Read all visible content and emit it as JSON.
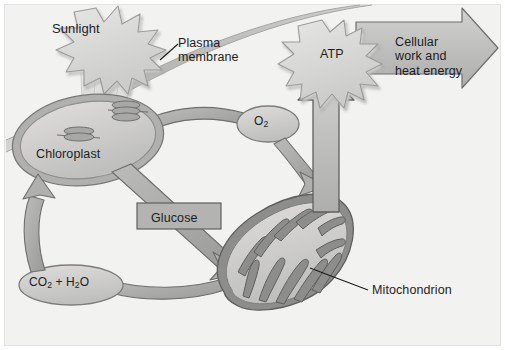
{
  "diagram": {
    "type": "biology-process-diagram",
    "background_color": "#f2f2f1",
    "ink_color": "#1d1d1f",
    "palette": {
      "membrane_band": "#b9b9b7",
      "organelle_fill": "#cfcfcd",
      "organelle_outline": "#8d8d8b",
      "arrow_fill": "#a9a9a7",
      "arrow_outline": "#6f6f6d",
      "burst_fill": "#d9d9d7",
      "label_box": "#b3b3b1",
      "block_arrow": "#c2c2c0"
    }
  },
  "labels": {
    "sunlight": "Sunlight",
    "plasma_membrane": "Plasma\nmembrane",
    "chloroplast": "Chloroplast",
    "oxygen": "O",
    "oxygen_sub": "2",
    "glucose": "Glucose",
    "co2_water_a": "CO",
    "co2_water_sub1": "2",
    "co2_water_b": " + H",
    "co2_water_sub2": "2",
    "co2_water_c": "O",
    "atp": "ATP",
    "cellular_work": "Cellular\nwork and\nheat energy",
    "mitochondrion": "Mitochondrion"
  },
  "elements": {
    "sunlight_burst": "starburst",
    "light_rays": "light-rays",
    "chloroplast_shape": "ellipse-with-thylakoids",
    "thylakoid_count": 2,
    "mitochondrion_shape": "bean-with-cristae",
    "atp_burst": "starburst",
    "cellular_work_arrow": "block-arrow-right",
    "glucose_arrow": "diagonal-arrow-down-right",
    "oxygen_arrow": "curved-arrow-down-right",
    "co2_arrow_up": "curved-arrow-up",
    "co2_arrow_in": "curved-arrow-left",
    "atp_arrow": "block-arrow-up"
  },
  "flows": [
    {
      "from": "Sunlight",
      "to": "Chloroplast",
      "via": "light rays"
    },
    {
      "from": "Chloroplast",
      "to": "O2",
      "via": "band"
    },
    {
      "from": "O2",
      "to": "Mitochondrion",
      "via": "curved arrow"
    },
    {
      "from": "Chloroplast",
      "to": "Mitochondrion",
      "via": "Glucose arrow"
    },
    {
      "from": "Mitochondrion",
      "to": "CO2 + H2O",
      "via": "curved arrow"
    },
    {
      "from": "CO2 + H2O",
      "to": "Chloroplast",
      "via": "curved arrow up"
    },
    {
      "from": "Mitochondrion",
      "to": "ATP",
      "via": "block arrow up"
    },
    {
      "from": "ATP",
      "to": "Cellular work and heat energy",
      "via": "block arrow right"
    }
  ]
}
